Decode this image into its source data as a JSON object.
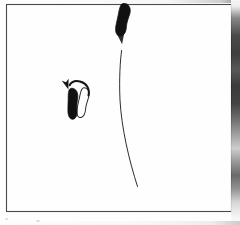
{
  "figure": {
    "background_color": "#fefefe",
    "ink_color": "#1a1a1a",
    "frame": {
      "name": "figure-border",
      "x": 6,
      "y": 4,
      "width": 226,
      "height": 208,
      "stroke_color": "#4a4a4a",
      "stroke_width": 1,
      "fill": "none"
    },
    "elements": [
      {
        "id": "footprint-top-filled",
        "label": "Top filled footprint",
        "kind": "footprint",
        "fill_style": "solid",
        "color": "#111111",
        "center_x": 123,
        "center_y": 20,
        "width": 15,
        "height": 33,
        "rotation_deg": 4
      },
      {
        "id": "footprint-middle-filled",
        "label": "Middle filled footprint",
        "kind": "footprint",
        "fill_style": "solid",
        "color": "#111111",
        "center_x": 73,
        "center_y": 104,
        "width": 13,
        "height": 31,
        "rotation_deg": -6
      },
      {
        "id": "footprint-middle-outline",
        "label": "Middle outlined footprint",
        "kind": "footprint",
        "fill_style": "outline",
        "color": "#2a2a2a",
        "center_x": 83,
        "center_y": 103,
        "width": 12,
        "height": 30,
        "rotation_deg": 5
      },
      {
        "id": "footprint-bottom-outline",
        "label": "Bottom outlined footprint",
        "kind": "footprint",
        "fill_style": "outline",
        "color": "#2a2a2a",
        "center_x": 143,
        "center_y": 196,
        "width": 12,
        "height": 31,
        "rotation_deg": 16
      },
      {
        "id": "arrow-long-curved",
        "label": "Long curved motion arrow from bottom footprint to top footprint",
        "kind": "arrow",
        "color": "#2e2e2e",
        "stroke_width": 1,
        "start_x": 137,
        "start_y": 186,
        "end_x": 122,
        "end_y": 44,
        "curve_direction": "bowed-left",
        "arrowhead": "filled-triangle",
        "arrowhead_size": 6
      },
      {
        "id": "arrow-short-curved",
        "label": "Short curved pivot arrow above middle footprints",
        "kind": "arrow",
        "color": "#151515",
        "stroke_width": 2,
        "start_x": 88,
        "start_y": 93,
        "end_x": 70,
        "end_y": 89,
        "curve_direction": "arched-up",
        "arrowhead": "filled-triangle",
        "arrowhead_size": 5
      }
    ]
  }
}
